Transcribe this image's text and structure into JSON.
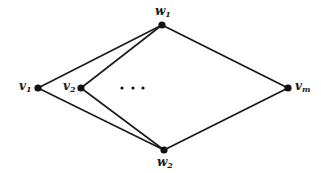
{
  "diagram": {
    "type": "graph",
    "nodes": [
      {
        "id": "w1",
        "base": "w",
        "sub": "1",
        "x": 162,
        "y": 25
      },
      {
        "id": "w2",
        "base": "w",
        "sub": "2",
        "x": 164,
        "y": 150
      },
      {
        "id": "v1",
        "base": "v",
        "sub": "1",
        "x": 38,
        "y": 88
      },
      {
        "id": "v2",
        "base": "v",
        "sub": "2",
        "x": 81,
        "y": 88
      },
      {
        "id": "vm",
        "base": "v",
        "sub": "m",
        "x": 288,
        "y": 88
      }
    ],
    "edges": [
      [
        "v1",
        "w1"
      ],
      [
        "v1",
        "w2"
      ],
      [
        "v2",
        "w1"
      ],
      [
        "v2",
        "w2"
      ],
      [
        "vm",
        "w1"
      ],
      [
        "vm",
        "w2"
      ]
    ],
    "ellipsis": "…",
    "colors": {
      "line": "#1a1a1a",
      "node": "#111111"
    }
  }
}
